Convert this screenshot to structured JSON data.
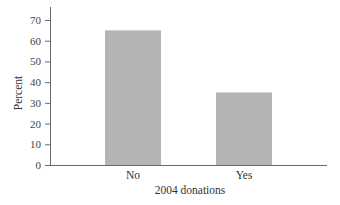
{
  "chart_data": {
    "type": "bar",
    "title": "",
    "xlabel": "2004 donations",
    "ylabel": "Percent",
    "categories": [
      "No",
      "Yes"
    ],
    "values": [
      65,
      35
    ],
    "ylim": [
      0,
      75
    ],
    "yticks": [
      0,
      10,
      20,
      30,
      40,
      50,
      60,
      70
    ],
    "grid": false,
    "legend": null
  },
  "colors": {
    "bar": "#b4b4b4",
    "axis": "#6a6a6a",
    "text": "#333333"
  }
}
